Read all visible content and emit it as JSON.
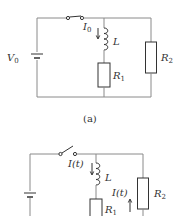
{
  "figure_a": {
    "caption": "(a)",
    "source_label": "V",
    "source_sub": "0",
    "current_label": "I",
    "current_sub": "0",
    "inductor_label": "L",
    "r1_label": "R",
    "r1_sub": "1",
    "r2_label": "R",
    "r2_sub": "2",
    "switch_state": "closed"
  },
  "figure_b": {
    "current_label_inductor": "I(t)",
    "current_label_r2": "I(t)",
    "inductor_label": "L",
    "r1_label": "R",
    "r1_sub": "1",
    "r2_label": "R",
    "r2_sub": "2",
    "switch_state": "open"
  },
  "colors": {
    "wire": "#8a8a8a",
    "component": "#333333"
  }
}
